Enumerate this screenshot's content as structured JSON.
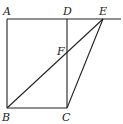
{
  "diagram": {
    "type": "geometry",
    "points": {
      "A": {
        "label": "A",
        "x": 7,
        "y": 19
      },
      "D": {
        "label": "D",
        "x": 67,
        "y": 19
      },
      "E": {
        "label": "E",
        "x": 103,
        "y": 19
      },
      "B": {
        "label": "B",
        "x": 7,
        "y": 108
      },
      "C": {
        "label": "C",
        "x": 67,
        "y": 108
      },
      "F": {
        "label": "F",
        "x": 67,
        "y": 52
      }
    },
    "segments": [
      "AD",
      "DE",
      "AB",
      "BC",
      "CD",
      "BE",
      "CE"
    ],
    "extended_line": "A-E extended to right edge",
    "labels": [
      "A",
      "D",
      "E",
      "F",
      "B",
      "C"
    ]
  }
}
